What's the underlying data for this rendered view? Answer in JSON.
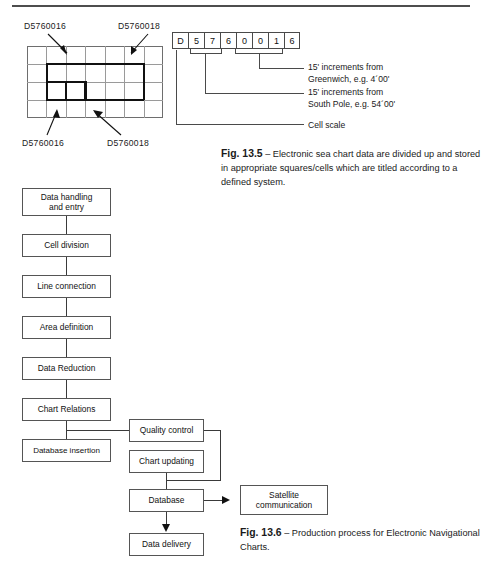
{
  "page": {
    "background": "#ffffff",
    "rule_color": "#4d4d4d"
  },
  "cell_diagram": {
    "grid": {
      "columns": 7,
      "rows": 4
    },
    "callouts": [
      {
        "id": "top-left",
        "text": "D5760016"
      },
      {
        "id": "top-right",
        "text": "D5760018"
      },
      {
        "id": "bottom-left",
        "text": "D5760016"
      },
      {
        "id": "bottom-right",
        "text": "D5760018"
      }
    ]
  },
  "code_string": {
    "characters": [
      "D",
      "5",
      "7",
      "6",
      "0",
      "0",
      "1",
      "6"
    ],
    "annotations": [
      {
        "id": "greenwich",
        "line1": "15' increments from",
        "line2": "Greenwich, e.g. 4´00'"
      },
      {
        "id": "south-pole",
        "line1": "15' increments from",
        "line2": "South Pole, e.g. 54´00'"
      },
      {
        "id": "cell-scale",
        "line1": "Cell scale",
        "line2": ""
      }
    ]
  },
  "fig135": {
    "label": "Fig. 13.5",
    "dash": "–",
    "line1": "Electronic sea chart data are divided up",
    "line2": "and stored in appropriate squares/cells which are titled",
    "line3": "according to a defined system."
  },
  "fig136": {
    "label": "Fig. 13.6",
    "dash": "–",
    "line1": "Production process for Electronic",
    "line2": "Navigational Charts."
  },
  "flowchart": {
    "nodes": [
      {
        "id": "data-handling",
        "line1": "Data handling",
        "line2": "and entry"
      },
      {
        "id": "cell-division",
        "line1": "Cell division",
        "line2": ""
      },
      {
        "id": "line-connection",
        "line1": "Line connection",
        "line2": ""
      },
      {
        "id": "area-definition",
        "line1": "Area definition",
        "line2": ""
      },
      {
        "id": "data-reduction",
        "line1": "Data Reduction",
        "line2": ""
      },
      {
        "id": "chart-relations",
        "line1": "Chart Relations",
        "line2": ""
      },
      {
        "id": "database-insertion",
        "line1": "Database insertion",
        "line2": ""
      },
      {
        "id": "quality-control",
        "line1": "Quality control",
        "line2": ""
      },
      {
        "id": "chart-updating",
        "line1": "Chart updating",
        "line2": ""
      },
      {
        "id": "database",
        "line1": "Database",
        "line2": ""
      },
      {
        "id": "data-delivery",
        "line1": "Data delivery",
        "line2": ""
      },
      {
        "id": "satellite",
        "line1": "Satellite",
        "line2": "communication"
      }
    ]
  }
}
